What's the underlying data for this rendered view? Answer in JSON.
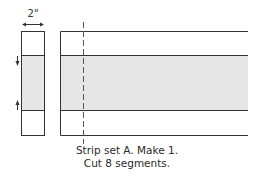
{
  "diagram": {
    "segment": {
      "width_label": "2\"",
      "pressing_arrows": [
        "down",
        "up"
      ]
    },
    "strip": {
      "bands": [
        {
          "name": "top-band",
          "fill": "#ffffff"
        },
        {
          "name": "middle-band",
          "fill": "#e6e6e6"
        },
        {
          "name": "bottom-band",
          "fill": "#ffffff"
        }
      ],
      "cut_line": "dashed"
    },
    "caption": {
      "line1": "Strip set A. Make 1.",
      "line2": "Cut 8 segments."
    },
    "colors": {
      "outline": "#333333",
      "shaded": "#e6e6e6",
      "background": "#ffffff"
    }
  }
}
